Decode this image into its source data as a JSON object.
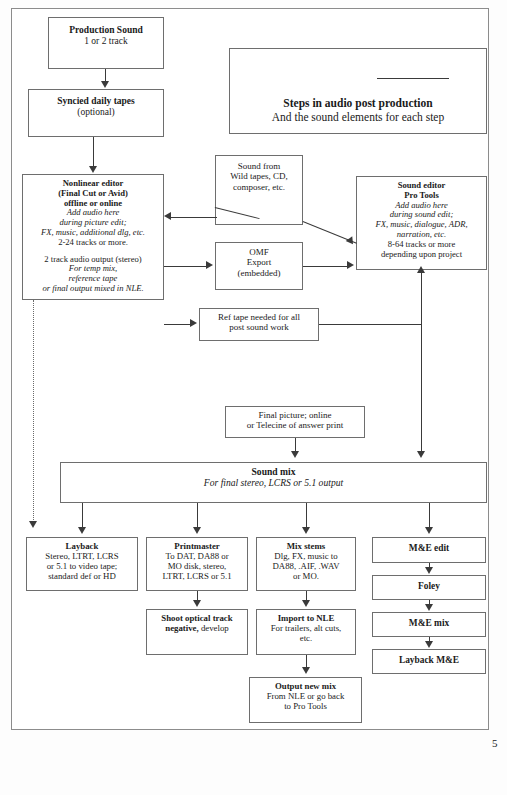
{
  "document": {
    "page_number": "5",
    "title_box": {
      "line1": "Steps in audio post production",
      "line2": "And the sound elements for each step"
    }
  },
  "nodes": {
    "production_sound": {
      "lines": [
        {
          "t": "Production Sound",
          "s": "b"
        },
        {
          "t": "1 or 2 track",
          "s": "n"
        }
      ]
    },
    "syncied_daily_tapes": {
      "lines": [
        {
          "t": "Syncied daily tapes",
          "s": "b"
        },
        {
          "t": "(optional)",
          "s": "n"
        }
      ]
    },
    "nonlinear_editor": {
      "lines": [
        {
          "t": "Nonlinear editor",
          "s": "b"
        },
        {
          "t": "(Final Cut or Avid)",
          "s": "b"
        },
        {
          "t": "offline or online",
          "s": "b"
        },
        {
          "t": "Add audio here",
          "s": "i"
        },
        {
          "t": "during picture edit;",
          "s": "i"
        },
        {
          "t": "FX, music, additional dlg, etc.",
          "s": "i"
        },
        {
          "t": "2-24 tracks or more.",
          "s": "n"
        },
        {
          "t": "",
          "s": "sp"
        },
        {
          "t": "2 track audio output (stereo)",
          "s": "n"
        },
        {
          "t": "For temp mix,",
          "s": "i"
        },
        {
          "t": "reference tape",
          "s": "i"
        },
        {
          "t": "or final output mixed in NLE.",
          "s": "i"
        },
        {
          "t": "",
          "s": "sp"
        },
        {
          "t": "Layback directly to master if",
          "s": "n"
        },
        {
          "t": "mixed in NLE.",
          "s": "n"
        }
      ]
    },
    "sound_from_wild_tapes": {
      "lines": [
        {
          "t": "Sound from",
          "s": "n"
        },
        {
          "t": "Wild tapes, CD,",
          "s": "n"
        },
        {
          "t": "composer, etc.",
          "s": "n"
        }
      ]
    },
    "omf_export": {
      "lines": [
        {
          "t": "OMF",
          "s": "n"
        },
        {
          "t": "Export",
          "s": "n"
        },
        {
          "t": "(embedded)",
          "s": "n"
        }
      ]
    },
    "ref_tape": {
      "lines": [
        {
          "t": "Ref tape needed for all",
          "s": "n"
        },
        {
          "t": "post sound work",
          "s": "n"
        }
      ]
    },
    "sound_editor_pro_tools": {
      "lines": [
        {
          "t": "Sound editor",
          "s": "b"
        },
        {
          "t": "Pro Tools",
          "s": "b"
        },
        {
          "t": "Add audio here",
          "s": "i"
        },
        {
          "t": "during sound edit;",
          "s": "i"
        },
        {
          "t": "FX, music, dialogue, ADR,",
          "s": "i"
        },
        {
          "t": "narration, etc.",
          "s": "i"
        },
        {
          "t": "8-64 tracks or more",
          "s": "n"
        },
        {
          "t": "depending upon project",
          "s": "n"
        }
      ]
    },
    "final_picture": {
      "lines": [
        {
          "t": "Final picture; online",
          "s": "n"
        },
        {
          "t": "or Telecine of answer print",
          "s": "n"
        }
      ]
    },
    "sound_mix": {
      "lines": [
        {
          "t": "Sound mix",
          "s": "b"
        },
        {
          "t": "For final stereo, LCRS or 5.1 output",
          "s": "i"
        }
      ]
    },
    "layback": {
      "lines": [
        {
          "t": "Layback",
          "s": "b"
        },
        {
          "t": "Stereo, LTRT, LCRS",
          "s": "n"
        },
        {
          "t": "or 5.1 to video tape;",
          "s": "n"
        },
        {
          "t": "standard def or HD",
          "s": "n"
        }
      ]
    },
    "printmaster": {
      "lines": [
        {
          "t": "Printmaster",
          "s": "b"
        },
        {
          "t": "To DAT, DA88 or",
          "s": "n"
        },
        {
          "t": "MO disk, stereo,",
          "s": "n"
        },
        {
          "t": "LTRT, LCRS or 5.1",
          "s": "n"
        }
      ]
    },
    "mix_stems": {
      "lines": [
        {
          "t": "Mix stems",
          "s": "b"
        },
        {
          "t": "Dlg, FX, music to",
          "s": "n"
        },
        {
          "t": "DA88, .AIF, .WAV",
          "s": "n"
        },
        {
          "t": "or MO.",
          "s": "n"
        }
      ]
    },
    "me_edit": {
      "lines": [
        {
          "t": "M&E edit",
          "s": "b"
        }
      ]
    },
    "shoot_optical": {
      "lines": [
        {
          "t": "Shoot optical track",
          "s": "b"
        },
        {
          "t": "negative, develop",
          "s": "bn"
        }
      ]
    },
    "import_to_nle": {
      "lines": [
        {
          "t": "Import to NLE",
          "s": "b"
        },
        {
          "t": "For trailers, alt cuts,",
          "s": "n"
        },
        {
          "t": "etc.",
          "s": "n"
        }
      ]
    },
    "foley": {
      "lines": [
        {
          "t": "Foley",
          "s": "b"
        }
      ]
    },
    "me_mix": {
      "lines": [
        {
          "t": "M&E mix",
          "s": "b"
        }
      ]
    },
    "layback_me": {
      "lines": [
        {
          "t": "Layback M&E",
          "s": "b"
        }
      ]
    },
    "output_new_mix": {
      "lines": [
        {
          "t": "Output new mix",
          "s": "b"
        },
        {
          "t": "From NLE or go back",
          "s": "n"
        },
        {
          "t": "to Pro Tools",
          "s": "n"
        }
      ]
    }
  }
}
